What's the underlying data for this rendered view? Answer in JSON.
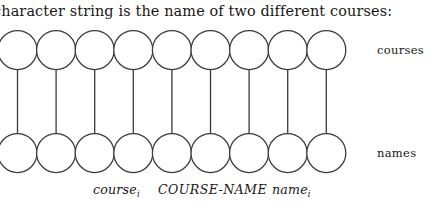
{
  "page": {
    "background_color": "#ffffff",
    "ink_color": "#171717",
    "stroke_color": "#3a3a3a"
  },
  "prose": {
    "line": "character string is the name of two different courses:",
    "clipped_at_left": true
  },
  "diagram": {
    "type": "entity-relationship-instance-diagram",
    "entity_count_per_row": 9,
    "circle_diameter": 39,
    "circle_step": 38.6,
    "first_circle_left": -2,
    "top_row": {
      "label": "courses",
      "cy": 24,
      "entity_name": "course"
    },
    "bottom_row": {
      "label": "names",
      "cy": 127,
      "entity_name": "name"
    },
    "connector_count": 9,
    "connector_style": "vertical-line"
  },
  "caption": {
    "left_operand": {
      "base": "course",
      "subscript": "i"
    },
    "relationship": "COURSE-NAME",
    "right_operand": {
      "base": "name",
      "subscript": "i"
    }
  }
}
